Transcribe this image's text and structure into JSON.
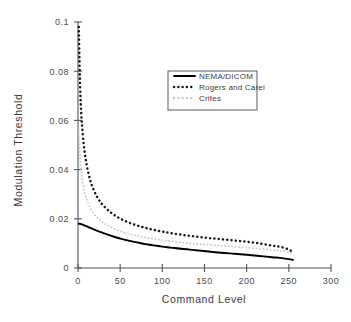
{
  "chart_data": {
    "type": "line",
    "title": "",
    "xlabel": "Command Level",
    "ylabel": "Modulation Threshold",
    "xlim": [
      0,
      300
    ],
    "ylim": [
      0,
      0.1
    ],
    "xticks": [
      "0",
      "50",
      "100",
      "150",
      "200",
      "250",
      "300"
    ],
    "xtick_values": [
      0,
      50,
      100,
      150,
      200,
      250,
      300
    ],
    "yticks": [
      "0",
      "0.02",
      "0.04",
      "0.06",
      "0.08",
      "0.1"
    ],
    "ytick_values": [
      0,
      0.02,
      0.04,
      0.06,
      0.08,
      0.1
    ],
    "grid": false,
    "legend_position": "upper-center",
    "x": [
      1,
      2,
      3,
      4,
      5,
      7,
      10,
      14,
      18,
      22,
      26,
      30,
      36,
      42,
      50,
      60,
      70,
      80,
      90,
      100,
      110,
      125,
      140,
      155,
      170,
      185,
      200,
      215,
      230,
      240,
      250,
      255
    ],
    "series": [
      {
        "name": "NEMA/DICOM",
        "style": "solid",
        "color": "#000000",
        "values": [
          0.018,
          0.018,
          0.0179,
          0.0178,
          0.0177,
          0.0174,
          0.017,
          0.0164,
          0.0158,
          0.0152,
          0.0147,
          0.0142,
          0.0135,
          0.0128,
          0.012,
          0.0111,
          0.0104,
          0.0097,
          0.0092,
          0.0087,
          0.0083,
          0.0077,
          0.0072,
          0.0067,
          0.0062,
          0.0058,
          0.0054,
          0.0049,
          0.0044,
          0.0041,
          0.0036,
          0.0033
        ]
      },
      {
        "name": "Rogers and Carel",
        "style": "dotted",
        "color": "#1a1a1a",
        "values": [
          0.098,
          0.08,
          0.069,
          0.062,
          0.057,
          0.0495,
          0.0425,
          0.0362,
          0.0322,
          0.0293,
          0.0271,
          0.0254,
          0.0234,
          0.0218,
          0.0201,
          0.0185,
          0.0173,
          0.0163,
          0.0155,
          0.0148,
          0.0142,
          0.0134,
          0.0128,
          0.0122,
          0.0117,
          0.0112,
          0.0107,
          0.01,
          0.0091,
          0.0086,
          0.0075,
          0.0063
        ]
      },
      {
        "name": "Crites",
        "style": "dotted-light",
        "color": "#c9c9c9",
        "values": [
          0.056,
          0.047,
          0.042,
          0.0385,
          0.0358,
          0.032,
          0.0282,
          0.0248,
          0.0225,
          0.0208,
          0.0195,
          0.0184,
          0.0172,
          0.0161,
          0.015,
          0.0139,
          0.0131,
          0.0124,
          0.0118,
          0.0113,
          0.0109,
          0.0103,
          0.0098,
          0.0094,
          0.009,
          0.0086,
          0.0082,
          0.0078,
          0.0073,
          0.007,
          0.0065,
          0.006
        ]
      }
    ],
    "legend": [
      {
        "label": "NEMA/DICOM",
        "style": "solid",
        "color": "#000000"
      },
      {
        "label": "Rogers and Carel",
        "style": "dotted",
        "color": "#1a1a1a"
      },
      {
        "label": "Crites",
        "style": "dotted-light",
        "color": "#c9c9c9"
      }
    ]
  }
}
